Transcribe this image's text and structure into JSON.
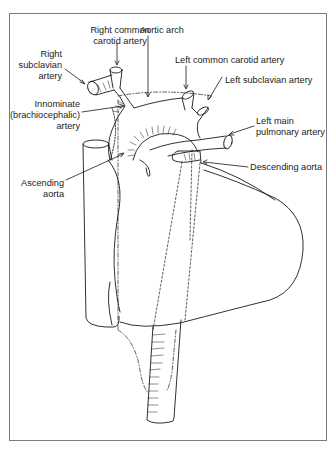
{
  "diagram": {
    "labels": {
      "right_common_carotid": [
        "Right common",
        "carotid artery"
      ],
      "aortic_arch": "Aortic arch",
      "right_subclavian": [
        "Right",
        "subclavian",
        "artery"
      ],
      "left_common_carotid": "Left common carotid artery",
      "left_subclavian": "Left subclavian artery",
      "innominate": [
        "Innominate",
        "(brachiocephalic)",
        "artery"
      ],
      "left_main_pulmonary": [
        "Left main",
        "pulmonary artery"
      ],
      "descending_aorta": "Descending aorta",
      "ascending_aorta": [
        "Ascending",
        "aorta"
      ]
    },
    "colors": {
      "line": "#1a1a1a",
      "frame": "#7a7a7a",
      "background": "#ffffff"
    }
  }
}
